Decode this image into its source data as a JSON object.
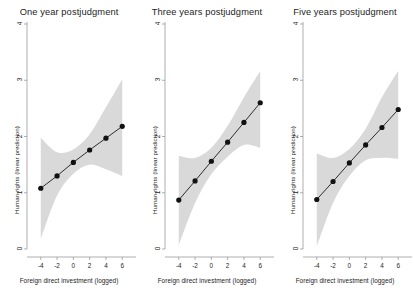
{
  "figure": {
    "background_color": "#ffffff",
    "panel_count": 3,
    "axis_color": "#8c8c8c",
    "line_color": "#1a1a1a",
    "marker_color": "#111111",
    "band_color": "#d9d9d9"
  },
  "chart_data": {
    "type": "line",
    "title": "",
    "xlabel": "Foreign direct investment (logged)",
    "ylabel": "Human rights (linear prediction)",
    "xlim": [
      -5.2,
      7.2
    ],
    "ylim": [
      0,
      4
    ],
    "xticks": [
      -4,
      -2,
      0,
      2,
      4,
      6
    ],
    "xtick_labels": [
      "-4",
      "-2",
      "0",
      "2",
      "4",
      "6"
    ],
    "yticks": [
      0,
      1,
      2,
      3,
      4
    ],
    "ytick_labels": [
      "0",
      "1",
      "2",
      "3",
      "4"
    ],
    "grid": false,
    "legend": "none",
    "marker": "filled-circle",
    "band_label": "95% confidence interval",
    "panels": [
      {
        "title": "One year postjudgment",
        "x": [
          -4,
          -2,
          0,
          2,
          4,
          6
        ],
        "values": [
          1.08,
          1.3,
          1.54,
          1.76,
          1.97,
          2.18
        ],
        "ci_lower": [
          0.18,
          0.95,
          1.34,
          1.5,
          1.42,
          1.3
        ],
        "ci_upper": [
          1.98,
          1.72,
          1.77,
          2.04,
          2.52,
          3.02
        ]
      },
      {
        "title": "Three years postjudgment",
        "x": [
          -4,
          -2,
          0,
          2,
          4,
          6
        ],
        "values": [
          0.87,
          1.21,
          1.56,
          1.9,
          2.25,
          2.6
        ],
        "ci_lower": [
          0.07,
          0.82,
          1.33,
          1.64,
          1.85,
          1.8
        ],
        "ci_upper": [
          1.66,
          1.62,
          1.8,
          2.19,
          2.7,
          3.16
        ]
      },
      {
        "title": "Five years postjudgment",
        "x": [
          -4,
          -2,
          0,
          2,
          4,
          6
        ],
        "values": [
          0.88,
          1.2,
          1.53,
          1.85,
          2.16,
          2.48
        ],
        "ci_lower": [
          0.05,
          0.82,
          1.3,
          1.58,
          1.62,
          1.6
        ],
        "ci_upper": [
          1.7,
          1.62,
          1.78,
          2.14,
          2.7,
          3.17
        ]
      }
    ]
  }
}
